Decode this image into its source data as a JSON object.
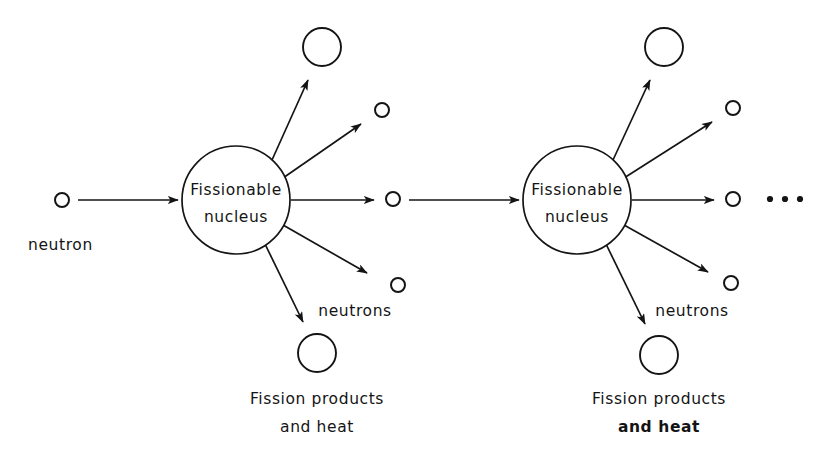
{
  "diagram": {
    "background_color": "#ffffff",
    "ink_color": "#141414",
    "width": 818,
    "height": 472,
    "labels": {
      "incoming_neutron": "neutron",
      "nucleus_line1": "Fissionable",
      "nucleus_line2": "nucleus",
      "neutrons": "neutrons",
      "products_line1": "Fission products",
      "products_line2": "and heat",
      "ellipsis": "• • •"
    },
    "stages": [
      {
        "id": "stage-1",
        "nucleus": {
          "cx": 236,
          "cy": 200,
          "r": 54,
          "line1": "Fissionable",
          "line2": "nucleus"
        },
        "incoming_neutron": {
          "cx": 62,
          "cy": 200,
          "r": 7,
          "label": "neutron"
        },
        "incoming_arrow": {
          "x1": 78,
          "y1": 200,
          "x2": 178,
          "y2": 200
        },
        "emissions": [
          {
            "kind": "fission-product",
            "cx": 322,
            "cy": 47,
            "r": 19,
            "arrow": {
              "x1": 272,
              "y1": 160,
              "x2": 308,
              "y2": 80
            }
          },
          {
            "kind": "neutron",
            "cx": 382,
            "cy": 110,
            "r": 7,
            "arrow": {
              "x1": 283,
              "y1": 178,
              "x2": 361,
              "y2": 124
            }
          },
          {
            "kind": "neutron",
            "cx": 393,
            "cy": 199,
            "r": 7,
            "arrow": {
              "x1": 291,
              "y1": 200,
              "x2": 374,
              "y2": 200
            }
          },
          {
            "kind": "neutron",
            "cx": 398,
            "cy": 285,
            "r": 7,
            "arrow": {
              "x1": 283,
              "y1": 225,
              "x2": 365,
              "y2": 272
            }
          },
          {
            "kind": "fission-product",
            "cx": 317,
            "cy": 353,
            "r": 19,
            "arrow": {
              "x1": 265,
              "y1": 244,
              "x2": 303,
              "y2": 322
            }
          }
        ],
        "neutrons_label": {
          "x": 355,
          "y": 311,
          "text": "neutrons"
        },
        "products_caption": {
          "x": 317,
          "y": 399,
          "line1": "Fission products",
          "line2": "and heat",
          "bold_line2": false
        }
      },
      {
        "id": "stage-2",
        "nucleus": {
          "cx": 577,
          "cy": 200,
          "r": 54,
          "line1": "Fissionable",
          "line2": "nucleus"
        },
        "incoming_arrow": {
          "x1": 409,
          "y1": 200,
          "x2": 519,
          "y2": 200
        },
        "emissions": [
          {
            "kind": "fission-product",
            "cx": 664,
            "cy": 47,
            "r": 19,
            "arrow": {
              "x1": 613,
              "y1": 160,
              "x2": 650,
              "y2": 80
            }
          },
          {
            "kind": "neutron",
            "cx": 733,
            "cy": 108,
            "r": 7,
            "arrow": {
              "x1": 624,
              "y1": 178,
              "x2": 712,
              "y2": 122
            }
          },
          {
            "kind": "neutron",
            "cx": 733,
            "cy": 199,
            "r": 7,
            "arrow": {
              "x1": 632,
              "y1": 200,
              "x2": 714,
              "y2": 200
            }
          },
          {
            "kind": "neutron",
            "cx": 731,
            "cy": 283,
            "r": 7,
            "arrow": {
              "x1": 624,
              "y1": 225,
              "x2": 706,
              "y2": 271
            }
          },
          {
            "kind": "fission-product",
            "cx": 659,
            "cy": 355,
            "r": 19,
            "arrow": {
              "x1": 606,
              "y1": 244,
              "x2": 645,
              "y2": 324
            }
          }
        ],
        "neutrons_label": {
          "x": 692,
          "y": 311,
          "text": "neutrons"
        },
        "products_caption": {
          "x": 659,
          "y": 399,
          "line1": "Fission products",
          "line2": "and heat",
          "bold_line2": true
        }
      }
    ],
    "ellipsis_dots": [
      {
        "cx": 770,
        "cy": 199,
        "r": 3.1
      },
      {
        "cx": 785,
        "cy": 199,
        "r": 3.1
      },
      {
        "cx": 800,
        "cy": 199,
        "r": 3.1
      }
    ]
  }
}
